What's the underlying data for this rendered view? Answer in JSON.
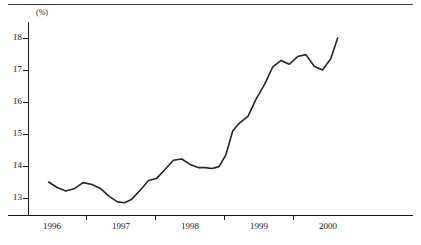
{
  "figure": {
    "title": "",
    "unit_label": "(%)"
  },
  "chart_data": {
    "type": "line",
    "title": "",
    "xlabel": "",
    "ylabel": "(%)",
    "ylim": [
      12.5,
      18.4
    ],
    "xlim": [
      1995.75,
      2000.3
    ],
    "grid": false,
    "legend": null,
    "y_ticks": [
      13,
      14,
      15,
      16,
      17,
      18
    ],
    "y_tick_labels": [
      "13",
      "14",
      "15",
      "16",
      "17",
      "18"
    ],
    "x_ticks": [
      1996,
      1997,
      1998,
      1999,
      2000
    ],
    "x_tick_labels": [
      "1996",
      "1997",
      "1998",
      "1999",
      "2000"
    ],
    "x_minor_ticks": [
      1996.5,
      1997.5,
      1998.5,
      1999.5
    ],
    "line_color": "#262626",
    "line_width": 1.6,
    "series": [
      {
        "name": "rate",
        "x": [
          1995.95,
          1996.08,
          1996.2,
          1996.33,
          1996.45,
          1996.58,
          1996.7,
          1996.83,
          1996.95,
          1997.05,
          1997.15,
          1997.28,
          1997.4,
          1997.52,
          1997.64,
          1997.76,
          1997.88,
          1998.0,
          1998.12,
          1998.22,
          1998.32,
          1998.42,
          1998.52,
          1998.62,
          1998.72,
          1998.84,
          1998.96,
          1999.08,
          1999.2,
          1999.32,
          1999.44,
          1999.56,
          1999.68,
          1999.8,
          1999.92,
          2000.04,
          2000.14
        ],
        "values": [
          13.5,
          13.32,
          13.22,
          13.3,
          13.48,
          13.42,
          13.3,
          13.05,
          12.88,
          12.85,
          12.95,
          13.25,
          13.55,
          13.62,
          13.9,
          14.18,
          14.22,
          14.05,
          13.95,
          13.95,
          13.92,
          13.98,
          14.35,
          15.1,
          15.35,
          15.55,
          16.1,
          16.55,
          17.1,
          17.3,
          17.18,
          17.42,
          17.48,
          17.12,
          17.0,
          17.35,
          18.0
        ]
      }
    ]
  }
}
